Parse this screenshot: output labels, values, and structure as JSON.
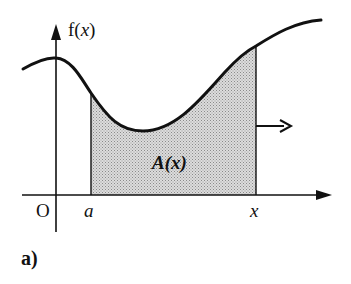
{
  "diagram": {
    "panel_label": "a)",
    "y_axis_label": "f(x)",
    "y_axis_label_parts": {
      "f": "f(",
      "x": "x",
      "close": ")"
    },
    "origin_label": "O",
    "lower_bound_label": "a",
    "upper_bound_label": "x",
    "area_label": "A(x)",
    "area_label_parts": {
      "A": "A(",
      "x": "x",
      "close": ")"
    },
    "arrow_meaning": "upper bound x moves right",
    "colors": {
      "stroke": "#111111",
      "area_fill": "#c8c8c8",
      "background": "#ffffff"
    }
  }
}
